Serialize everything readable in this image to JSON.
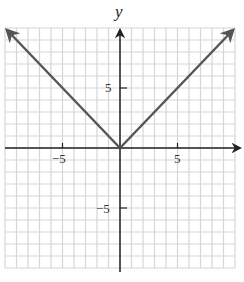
{
  "chart_data": {
    "type": "line",
    "title": "",
    "function": "y = |x|",
    "xlabel": "",
    "ylabel": "y",
    "xlim": [
      -10,
      10
    ],
    "ylim": [
      -10,
      10
    ],
    "grid": true,
    "grid_step": 1,
    "x_ticks": [
      -5,
      5
    ],
    "y_ticks": [
      5,
      -5
    ],
    "x_tick_labels": [
      "−5",
      "5"
    ],
    "y_tick_labels": [
      "5",
      "−5"
    ],
    "series": [
      {
        "name": "y = |x|",
        "x": [
          -10,
          0,
          10
        ],
        "y": [
          10,
          0,
          10
        ],
        "arrows_at_ends": true
      }
    ],
    "colors": {
      "grid": "#d6d6d6",
      "axis": "#222222",
      "curve": "#555555"
    }
  },
  "labels": {
    "y_axis_title": "y",
    "x_tick_neg5": "−5",
    "x_tick_5": "5",
    "y_tick_5": "5",
    "y_tick_neg5": "−5"
  }
}
